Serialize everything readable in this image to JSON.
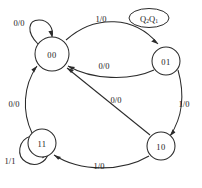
{
  "diagram": {
    "kind": "state-transition-diagram",
    "legend": {
      "label_main_1": "Q",
      "label_sub_1": "2",
      "label_main_2": "Q",
      "label_sub_2": "1",
      "label_full": "Q2Q1"
    },
    "states": [
      {
        "id": "s00",
        "label": "00",
        "cx": 52,
        "cy": 54,
        "r": 17
      },
      {
        "id": "s01",
        "label": "01",
        "cx": 166,
        "cy": 61,
        "r": 14
      },
      {
        "id": "s10",
        "label": "10",
        "cx": 161,
        "cy": 146,
        "r": 14
      },
      {
        "id": "s11",
        "label": "11",
        "cx": 42,
        "cy": 143,
        "r": 14
      }
    ],
    "transitions": [
      {
        "id": "t-00-00",
        "from": "00",
        "to": "00",
        "label": "0/0",
        "lx": 19,
        "ly": 23
      },
      {
        "id": "t-00-01",
        "from": "00",
        "to": "01",
        "label": "1/0",
        "lx": 101,
        "ly": 19
      },
      {
        "id": "t-01-00",
        "from": "01",
        "to": "00",
        "label": "0/0",
        "lx": 104,
        "ly": 66
      },
      {
        "id": "t-01-10",
        "from": "01",
        "to": "10",
        "label": "1/0",
        "lx": 184,
        "ly": 104
      },
      {
        "id": "t-10-00",
        "from": "10",
        "to": "00",
        "label": "0/0",
        "lx": 116,
        "ly": 100
      },
      {
        "id": "t-10-11",
        "from": "10",
        "to": "11",
        "label": "1/0",
        "lx": 99,
        "ly": 166
      },
      {
        "id": "t-11-00",
        "from": "11",
        "to": "00",
        "label": "0/0",
        "lx": 14,
        "ly": 104
      },
      {
        "id": "t-11-11",
        "from": "11",
        "to": "11",
        "label": "1/1",
        "lx": 10,
        "ly": 161
      }
    ]
  },
  "colors": {
    "stroke": "#2b2b2b",
    "text": "#1a1a1a",
    "background": "#ffffff"
  }
}
